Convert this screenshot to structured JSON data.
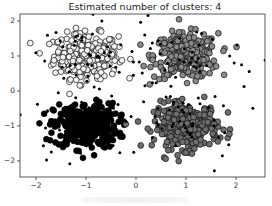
{
  "chart_data": {
    "type": "scatter",
    "title": "Estimated number of clusters: 4",
    "xlabel": "",
    "ylabel": "",
    "xlim": [
      -2.32,
      2.58
    ],
    "ylim": [
      -2.46,
      2.2
    ],
    "xticks": [
      -2,
      -1,
      0,
      1,
      2
    ],
    "yticks": [
      -2,
      -1,
      0,
      1,
      2
    ],
    "grid": false,
    "legend": null,
    "series": [
      {
        "name": "cluster 0",
        "center": [
          -1,
          1
        ],
        "std": 0.32,
        "core_points": 300,
        "fill": "#f2f2f2",
        "edge": "#111111"
      },
      {
        "name": "cluster 1",
        "center": [
          1,
          1
        ],
        "std": 0.32,
        "core_points": 300,
        "fill": "#8a8a8a",
        "edge": "#111111"
      },
      {
        "name": "cluster 2",
        "center": [
          -1,
          -1
        ],
        "std": 0.32,
        "core_points": 300,
        "fill": "#000000",
        "edge": "#000000"
      },
      {
        "name": "cluster 3",
        "center": [
          1,
          -1
        ],
        "std": 0.32,
        "core_points": 300,
        "fill": "#6e6e6e",
        "edge": "#111111"
      },
      {
        "name": "noise",
        "marker": "small dots",
        "count": 110,
        "fill": "#000000"
      }
    ]
  },
  "figure": {
    "title": "Estimated number of clusters: 4",
    "caption": ""
  }
}
